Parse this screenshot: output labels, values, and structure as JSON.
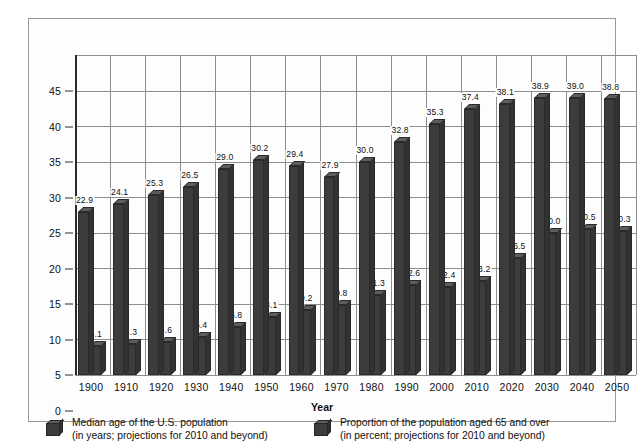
{
  "chart_data": {
    "type": "bar",
    "title": "",
    "subtitle": "",
    "xlabel": "Year",
    "ylabel": "",
    "ylim": [
      0,
      45
    ],
    "ytick_step": 5,
    "yticks": [
      "0",
      "5",
      "10",
      "15",
      "20",
      "25",
      "30",
      "35",
      "40",
      "45"
    ],
    "grid": true,
    "grid_axes": "both",
    "legend_position": "bottom",
    "style": "3d-column",
    "categories": [
      "1900",
      "1910",
      "1920",
      "1930",
      "1940",
      "1950",
      "1960",
      "1970",
      "1980",
      "1990",
      "2000",
      "2010",
      "2020",
      "2030",
      "2040",
      "2050"
    ],
    "series": [
      {
        "name": "Median age of the U.S. population",
        "unit": "years",
        "values": [
          22.9,
          24.1,
          25.3,
          26.5,
          29.0,
          30.2,
          29.4,
          27.9,
          30.0,
          32.8,
          35.3,
          37.4,
          38.1,
          38.9,
          39.0,
          38.8
        ],
        "labels": [
          "22.9",
          "24.1",
          "25.3",
          "26.5",
          "29.0",
          "30.2",
          "29.4",
          "27.9",
          "30.0",
          "32.8",
          "35.3",
          "37.4",
          "38.1",
          "38.9",
          "39.0",
          "38.8"
        ],
        "color": "#3c3c3c"
      },
      {
        "name": "Proportion of the population aged 65 and over",
        "unit": "percent",
        "values": [
          4.1,
          4.3,
          4.6,
          5.4,
          6.8,
          8.1,
          9.2,
          9.8,
          11.3,
          12.6,
          12.4,
          13.2,
          16.5,
          20.0,
          20.5,
          20.3
        ],
        "labels": [
          "4.1",
          "4.3",
          "4.6",
          "5.4",
          "6.8",
          "8.1",
          "9.2",
          "9.8",
          "11.3",
          "12.6",
          "12.4",
          "13.2",
          "16.5",
          "20.0",
          "20.5",
          "20.3"
        ],
        "color": "#3c3c3c"
      }
    ]
  },
  "legend": {
    "items": [
      {
        "line1": "Median age of the U.S. population",
        "line2": "(in years; projections for 2010 and beyond)"
      },
      {
        "line1": "Proportion of the population aged 65 and over",
        "line2": "(in percent; projections for 2010 and beyond)"
      }
    ]
  },
  "colors": {
    "bar_front": "#3c3c3c",
    "bar_top": "#5d5d5d",
    "bar_side": "#323232",
    "grid": "#8d8d8d",
    "axis": "#2b2b2b",
    "frame": "#9a9a9a",
    "background": "#ffffff"
  }
}
